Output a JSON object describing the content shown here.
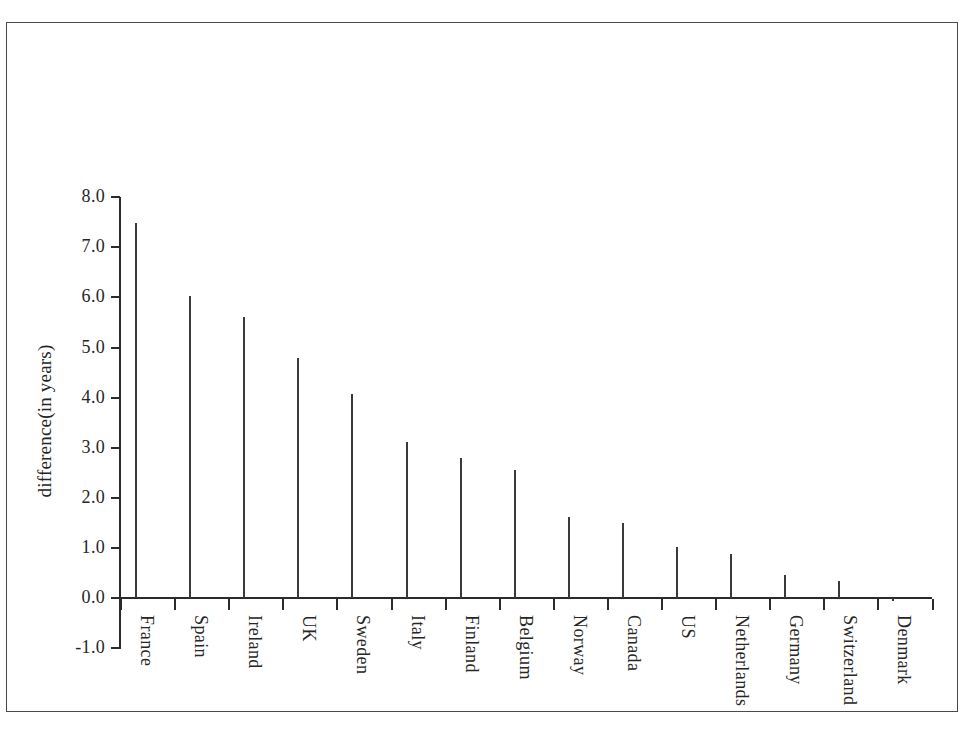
{
  "figure": {
    "frame_visible": true,
    "background": "#ffffff",
    "bar_fill": "#aeaeae",
    "bar_border": "#3a3a3a",
    "axis_color": "#2b2b2b"
  },
  "chart_data": {
    "type": "bar",
    "title": "",
    "xlabel": "",
    "ylabel": "difference(in years)",
    "ylim": [
      -1.0,
      8.0
    ],
    "ytick_labels": [
      "8.0",
      "7.0",
      "6.0",
      "5.0",
      "4.0",
      "3.0",
      "2.0",
      "1.0",
      "0.0",
      "-1.0"
    ],
    "yticks": [
      8.0,
      7.0,
      6.0,
      5.0,
      4.0,
      3.0,
      2.0,
      1.0,
      0.0,
      -1.0
    ],
    "grid": false,
    "legend": null,
    "categories": [
      "France",
      "Spain",
      "Ireland",
      "UK",
      "Sweden",
      "Italy",
      "Finland",
      "Belgium",
      "Norway",
      "Canada",
      "US",
      "Netherlands",
      "Germany",
      "Switzerland",
      "Denmark"
    ],
    "values": [
      7.48,
      6.03,
      5.6,
      4.8,
      4.08,
      3.12,
      2.8,
      2.55,
      1.62,
      1.5,
      1.02,
      0.87,
      0.45,
      0.33,
      -0.03
    ]
  }
}
